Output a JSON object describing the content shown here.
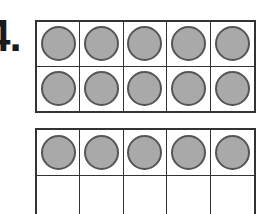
{
  "problem": {
    "number": "4."
  },
  "ten_frames": [
    {
      "id": "frame-1",
      "rows": 2,
      "cols": 5,
      "filled": [
        true,
        true,
        true,
        true,
        true,
        true,
        true,
        true,
        true,
        true
      ]
    },
    {
      "id": "frame-2",
      "rows": 2,
      "cols": 5,
      "filled": [
        true,
        true,
        true,
        true,
        true,
        false,
        false,
        false,
        false,
        false
      ]
    }
  ],
  "colors": {
    "counter_fill": "#a9a9a9",
    "counter_stroke": "#555555",
    "grid_line": "#333333"
  }
}
